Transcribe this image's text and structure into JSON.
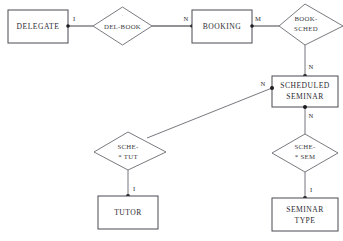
{
  "diagram": {
    "kind": "entity-relationship-diagram",
    "background_color": "#ffffff",
    "line_color": "#77777f",
    "entity_border_color": "#4a4a52",
    "relationship_border_color": "#6a6a72",
    "text_color": "#2b2b31",
    "entities": [
      {
        "id": "delegate",
        "label": "DELEGATE",
        "lines": [
          "DELEGATE"
        ]
      },
      {
        "id": "booking",
        "label": "BOOKING",
        "lines": [
          "BOOKING"
        ]
      },
      {
        "id": "scheduled_seminar",
        "label": "SCHEDULED SEMINAR",
        "lines": [
          "SCHEDULED",
          "SEMINAR"
        ]
      },
      {
        "id": "tutor",
        "label": "TUTOR",
        "lines": [
          "TUTOR"
        ]
      },
      {
        "id": "seminar_type",
        "label": "SEMINAR TYPE",
        "lines": [
          "SEMINAR",
          "TYPE"
        ]
      }
    ],
    "relationships": [
      {
        "id": "del_book",
        "label": "DEL-BOOK",
        "lines": [
          "DEL-BOOK"
        ],
        "mark": "."
      },
      {
        "id": "book_sched",
        "label": "BOOK-SCHED",
        "lines": [
          "BOOK-",
          "SCHED"
        ],
        "mark": ""
      },
      {
        "id": "sche_tut",
        "label": "SCHE-* TUT",
        "lines": [
          "SCHE-",
          "* TUT"
        ],
        "mark": ""
      },
      {
        "id": "sche_sem",
        "label": "SCHE-* SEM",
        "lines": [
          "SCHE-",
          "* SEM"
        ],
        "mark": ""
      }
    ],
    "cardinalities": [
      {
        "id": "card_delegate_delbook",
        "text": "I",
        "near": "delegate"
      },
      {
        "id": "card_delbook_booking",
        "text": "N",
        "near": "booking"
      },
      {
        "id": "card_booking_booksched",
        "text": "M",
        "near": "booking"
      },
      {
        "id": "card_booksched_sched",
        "text": "N",
        "near": "scheduled_seminar"
      },
      {
        "id": "card_schedtut_sched",
        "text": "N",
        "near": "scheduled_seminar"
      },
      {
        "id": "card_sched_schesem",
        "text": "N",
        "near": "scheduled_seminar"
      },
      {
        "id": "card_schesem_semtype",
        "text": "I",
        "near": "seminar_type"
      },
      {
        "id": "card_schetut_tutor",
        "text": "I",
        "near": "tutor"
      }
    ]
  }
}
